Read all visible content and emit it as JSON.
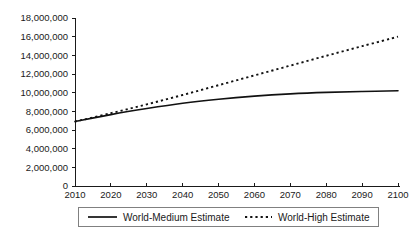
{
  "chart_data": {
    "type": "line",
    "title": "",
    "subtitle": "",
    "xlabel": "",
    "ylabel": "",
    "xlim": [
      2010,
      2100
    ],
    "ylim": [
      0,
      18000000
    ],
    "grid": false,
    "legend_position": "bottom",
    "x": [
      2010,
      2020,
      2030,
      2040,
      2050,
      2060,
      2070,
      2080,
      2090,
      2100
    ],
    "xtick_labels": [
      "2010",
      "2020",
      "2030",
      "2040",
      "2050",
      "2060",
      "2070",
      "2080",
      "2090",
      "2100"
    ],
    "ytick_values": [
      0,
      2000000,
      4000000,
      6000000,
      8000000,
      10000000,
      12000000,
      14000000,
      16000000,
      18000000
    ],
    "ytick_labels": [
      "0",
      "2,000,000",
      "4,000,000",
      "6,000,000",
      "8,000,000",
      "10,000,000",
      "12,000,000",
      "14,000,000",
      "16,000,000",
      "18,000,000"
    ],
    "series": [
      {
        "name": "World-Medium Estimate",
        "style": "solid",
        "color": "#111111",
        "values": [
          6900000,
          7650000,
          8300000,
          8870000,
          9300000,
          9630000,
          9870000,
          10030000,
          10130000,
          10200000
        ]
      },
      {
        "name": "World-High Estimate",
        "style": "dotted",
        "color": "#111111",
        "values": [
          6900000,
          7800000,
          8750000,
          9750000,
          10800000,
          11850000,
          12900000,
          13950000,
          14980000,
          16000000
        ]
      }
    ]
  },
  "legend": {
    "items": [
      {
        "label": "World-Medium Estimate",
        "style": "solid"
      },
      {
        "label": "World-High Estimate",
        "style": "dotted"
      }
    ]
  }
}
